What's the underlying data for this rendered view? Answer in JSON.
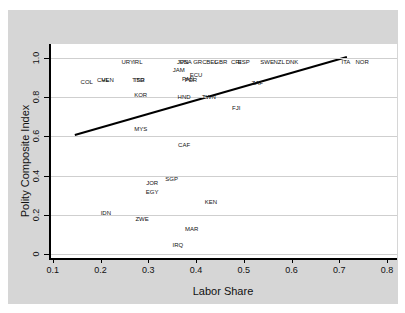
{
  "chart_data": {
    "type": "scatter",
    "title": "",
    "xlabel": "Labor Share",
    "ylabel": "Polity Composite Index",
    "xlim": [
      0.094,
      0.821
    ],
    "ylim": [
      -0.02,
      1.071
    ],
    "x_ticks": [
      0.1,
      0.2,
      0.3,
      0.4,
      0.5,
      0.6,
      0.7,
      0.8
    ],
    "x_tick_labels": [
      "0.1",
      "0.2",
      "0.3",
      "0.4",
      "0.5",
      "0.6",
      "0.7",
      "0.8"
    ],
    "y_ticks": [
      0,
      0.2,
      0.4,
      0.6,
      0.8,
      1.0
    ],
    "y_tick_labels": [
      "0",
      "0.2",
      "0.4",
      "0.6",
      "0.8",
      "1.0"
    ],
    "grid": "horizontal",
    "legend": "none",
    "marker_style": "country-code-labels",
    "points": [
      {
        "label": "URY",
        "x": 0.257,
        "y": 0.98
      },
      {
        "label": "IRL",
        "x": 0.278,
        "y": 0.98
      },
      {
        "label": "JPN",
        "x": 0.372,
        "y": 0.98
      },
      {
        "label": "USA",
        "x": 0.378,
        "y": 0.98
      },
      {
        "label": "GRC",
        "x": 0.408,
        "y": 0.98
      },
      {
        "label": "BEL",
        "x": 0.433,
        "y": 0.98
      },
      {
        "label": "GBR",
        "x": 0.452,
        "y": 0.98
      },
      {
        "label": "CRI",
        "x": 0.484,
        "y": 0.98
      },
      {
        "label": "ESP",
        "x": 0.5,
        "y": 0.98
      },
      {
        "label": "SWE",
        "x": 0.549,
        "y": 0.98
      },
      {
        "label": "NZL",
        "x": 0.574,
        "y": 0.98
      },
      {
        "label": "DNK",
        "x": 0.601,
        "y": 0.98
      },
      {
        "label": "ITA",
        "x": 0.714,
        "y": 0.98
      },
      {
        "label": "NOR",
        "x": 0.748,
        "y": 0.98
      },
      {
        "label": "JAM",
        "x": 0.364,
        "y": 0.94
      },
      {
        "label": "ECU",
        "x": 0.4,
        "y": 0.913
      },
      {
        "label": "PAN",
        "x": 0.383,
        "y": 0.893
      },
      {
        "label": "PER",
        "x": 0.389,
        "y": 0.888
      },
      {
        "label": "COL",
        "x": 0.171,
        "y": 0.877
      },
      {
        "label": "CHL",
        "x": 0.205,
        "y": 0.885
      },
      {
        "label": "VEN",
        "x": 0.215,
        "y": 0.885
      },
      {
        "label": "TTO",
        "x": 0.279,
        "y": 0.885
      },
      {
        "label": "ISR",
        "x": 0.282,
        "y": 0.885
      },
      {
        "label": "ZAF",
        "x": 0.528,
        "y": 0.872
      },
      {
        "label": "KOR",
        "x": 0.284,
        "y": 0.811
      },
      {
        "label": "HND",
        "x": 0.375,
        "y": 0.801
      },
      {
        "label": "TWN",
        "x": 0.427,
        "y": 0.801
      },
      {
        "label": "FJI",
        "x": 0.484,
        "y": 0.745
      },
      {
        "label": "MYS",
        "x": 0.284,
        "y": 0.638
      },
      {
        "label": "CAF",
        "x": 0.375,
        "y": 0.556
      },
      {
        "label": "SGP",
        "x": 0.349,
        "y": 0.383
      },
      {
        "label": "JOR",
        "x": 0.308,
        "y": 0.362
      },
      {
        "label": "EGY",
        "x": 0.308,
        "y": 0.316
      },
      {
        "label": "KEN",
        "x": 0.431,
        "y": 0.265
      },
      {
        "label": "IDN",
        "x": 0.211,
        "y": 0.209
      },
      {
        "label": "ZWE",
        "x": 0.287,
        "y": 0.179
      },
      {
        "label": "MAR",
        "x": 0.391,
        "y": 0.128
      },
      {
        "label": "IRQ",
        "x": 0.362,
        "y": 0.046
      }
    ],
    "fit_line": {
      "x1": 0.146,
      "y1": 0.607,
      "x2": 0.716,
      "y2": 1.005
    },
    "colors": {
      "figure_background": "#d6d6d6",
      "plot_background": "#ffffff",
      "gridline": "#cfcfcf",
      "axis": "#000000",
      "fit_line": "#000000",
      "point_label": "#111111"
    }
  }
}
